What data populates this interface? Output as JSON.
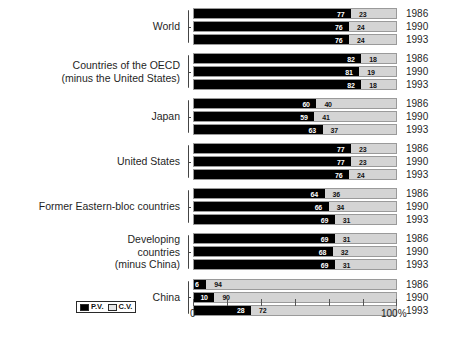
{
  "chart_data": {
    "type": "bar",
    "title": "",
    "subtitle": "",
    "xlabel": "",
    "ylabel": "",
    "orientation": "horizontal",
    "stacked": true,
    "xlim": [
      0,
      100
    ],
    "x_tick_labels": [
      "0",
      "100%"
    ],
    "grid": false,
    "legend_position": "bottom-left",
    "legend": [
      {
        "key": "pv",
        "label": "P.V.",
        "color": "#000000"
      },
      {
        "key": "cv",
        "label": "C.V.",
        "color": "#d4d4d4"
      }
    ],
    "series": [
      {
        "name": "P.V.",
        "color": "#000000"
      },
      {
        "name": "C.V.",
        "color": "#d4d4d4"
      }
    ],
    "groups": [
      {
        "label": "World",
        "rows": [
          {
            "year": "1986",
            "pv": 77,
            "cv": 23
          },
          {
            "year": "1990",
            "pv": 76,
            "cv": 24
          },
          {
            "year": "1993",
            "pv": 76,
            "cv": 24
          }
        ]
      },
      {
        "label": "Countries of the OECD\n(minus the United States)",
        "rows": [
          {
            "year": "1986",
            "pv": 82,
            "cv": 18
          },
          {
            "year": "1990",
            "pv": 81,
            "cv": 19
          },
          {
            "year": "1993",
            "pv": 82,
            "cv": 18
          }
        ]
      },
      {
        "label": "Japan",
        "rows": [
          {
            "year": "1986",
            "pv": 60,
            "cv": 40
          },
          {
            "year": "1990",
            "pv": 59,
            "cv": 41
          },
          {
            "year": "1993",
            "pv": 63,
            "cv": 37
          }
        ]
      },
      {
        "label": "United States",
        "rows": [
          {
            "year": "1986",
            "pv": 77,
            "cv": 23
          },
          {
            "year": "1990",
            "pv": 77,
            "cv": 23
          },
          {
            "year": "1993",
            "pv": 76,
            "cv": 24
          }
        ]
      },
      {
        "label": "Former Eastern-bloc countries",
        "rows": [
          {
            "year": "1986",
            "pv": 64,
            "cv": 36
          },
          {
            "year": "1990",
            "pv": 66,
            "cv": 34
          },
          {
            "year": "1993",
            "pv": 69,
            "cv": 31
          }
        ]
      },
      {
        "label": "Developing\ncountries\n(minus China)",
        "rows": [
          {
            "year": "1986",
            "pv": 69,
            "cv": 31
          },
          {
            "year": "1990",
            "pv": 68,
            "cv": 32
          },
          {
            "year": "1993",
            "pv": 69,
            "cv": 31
          }
        ]
      },
      {
        "label": "China",
        "rows": [
          {
            "year": "1986",
            "pv": 6,
            "cv": 94
          },
          {
            "year": "1990",
            "pv": 10,
            "cv": 90
          },
          {
            "year": "1993",
            "pv": 28,
            "cv": 72
          }
        ]
      }
    ]
  }
}
